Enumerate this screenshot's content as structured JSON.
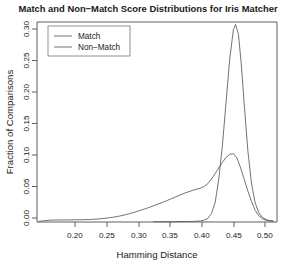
{
  "chart_data": {
    "type": "line",
    "title": "Match and Non−Match Score Distributions for Iris Matcher",
    "xlabel": "Hamming Distance",
    "ylabel": "Fraction of Comparisons",
    "xlim": [
      0.175,
      0.505
    ],
    "ylim": [
      0.0,
      0.325
    ],
    "xticks": [
      0.2,
      0.25,
      0.3,
      0.35,
      0.4,
      0.45,
      0.5
    ],
    "xtick_labels": [
      "0.20",
      "0.25",
      "0.30",
      "0.35",
      "0.40",
      "0.45",
      "0.50"
    ],
    "yticks": [
      0.0,
      0.05,
      0.1,
      0.15,
      0.2,
      0.25,
      0.3
    ],
    "ytick_labels": [
      "0.00",
      "0.05",
      "0.10",
      "0.15",
      "0.20",
      "0.25",
      "0.30"
    ],
    "grid": false,
    "legend_position": "top-left",
    "legend_entries": [
      "Match",
      "Non−Match"
    ],
    "series": [
      {
        "name": "Match",
        "color": "#5a5a5a",
        "x": [
          0.178,
          0.19,
          0.2,
          0.21,
          0.22,
          0.23,
          0.24,
          0.25,
          0.26,
          0.27,
          0.28,
          0.29,
          0.3,
          0.31,
          0.32,
          0.33,
          0.34,
          0.35,
          0.36,
          0.37,
          0.38,
          0.39,
          0.4,
          0.405,
          0.41,
          0.415,
          0.42,
          0.425,
          0.43,
          0.435,
          0.44,
          0.445,
          0.45,
          0.455,
          0.46,
          0.465,
          0.47,
          0.475,
          0.48,
          0.485,
          0.49,
          0.495,
          0.5
        ],
        "y": [
          0.001,
          0.0028,
          0.0032,
          0.0033,
          0.0034,
          0.0036,
          0.0038,
          0.0042,
          0.005,
          0.0062,
          0.0078,
          0.01,
          0.0128,
          0.0162,
          0.02,
          0.024,
          0.0285,
          0.033,
          0.038,
          0.043,
          0.0478,
          0.0518,
          0.055,
          0.058,
          0.0625,
          0.07,
          0.079,
          0.088,
          0.097,
          0.105,
          0.11,
          0.111,
          0.104,
          0.088,
          0.069,
          0.05,
          0.033,
          0.019,
          0.01,
          0.0052,
          0.0028,
          0.0016,
          0.001
        ]
      },
      {
        "name": "Non−Match",
        "color": "#5a5a5a",
        "x": [
          0.335,
          0.35,
          0.36,
          0.37,
          0.38,
          0.39,
          0.395,
          0.4,
          0.405,
          0.41,
          0.415,
          0.42,
          0.425,
          0.43,
          0.435,
          0.44,
          0.445,
          0.448,
          0.452,
          0.456,
          0.46,
          0.465,
          0.47,
          0.475,
          0.48,
          0.485,
          0.49,
          0.495,
          0.5
        ],
        "y": [
          0.0004,
          0.0005,
          0.0006,
          0.0007,
          0.0008,
          0.001,
          0.0013,
          0.0018,
          0.003,
          0.006,
          0.014,
          0.032,
          0.07,
          0.125,
          0.195,
          0.265,
          0.312,
          0.321,
          0.305,
          0.255,
          0.19,
          0.115,
          0.062,
          0.031,
          0.015,
          0.0075,
          0.004,
          0.0024,
          0.0016
        ]
      }
    ]
  }
}
